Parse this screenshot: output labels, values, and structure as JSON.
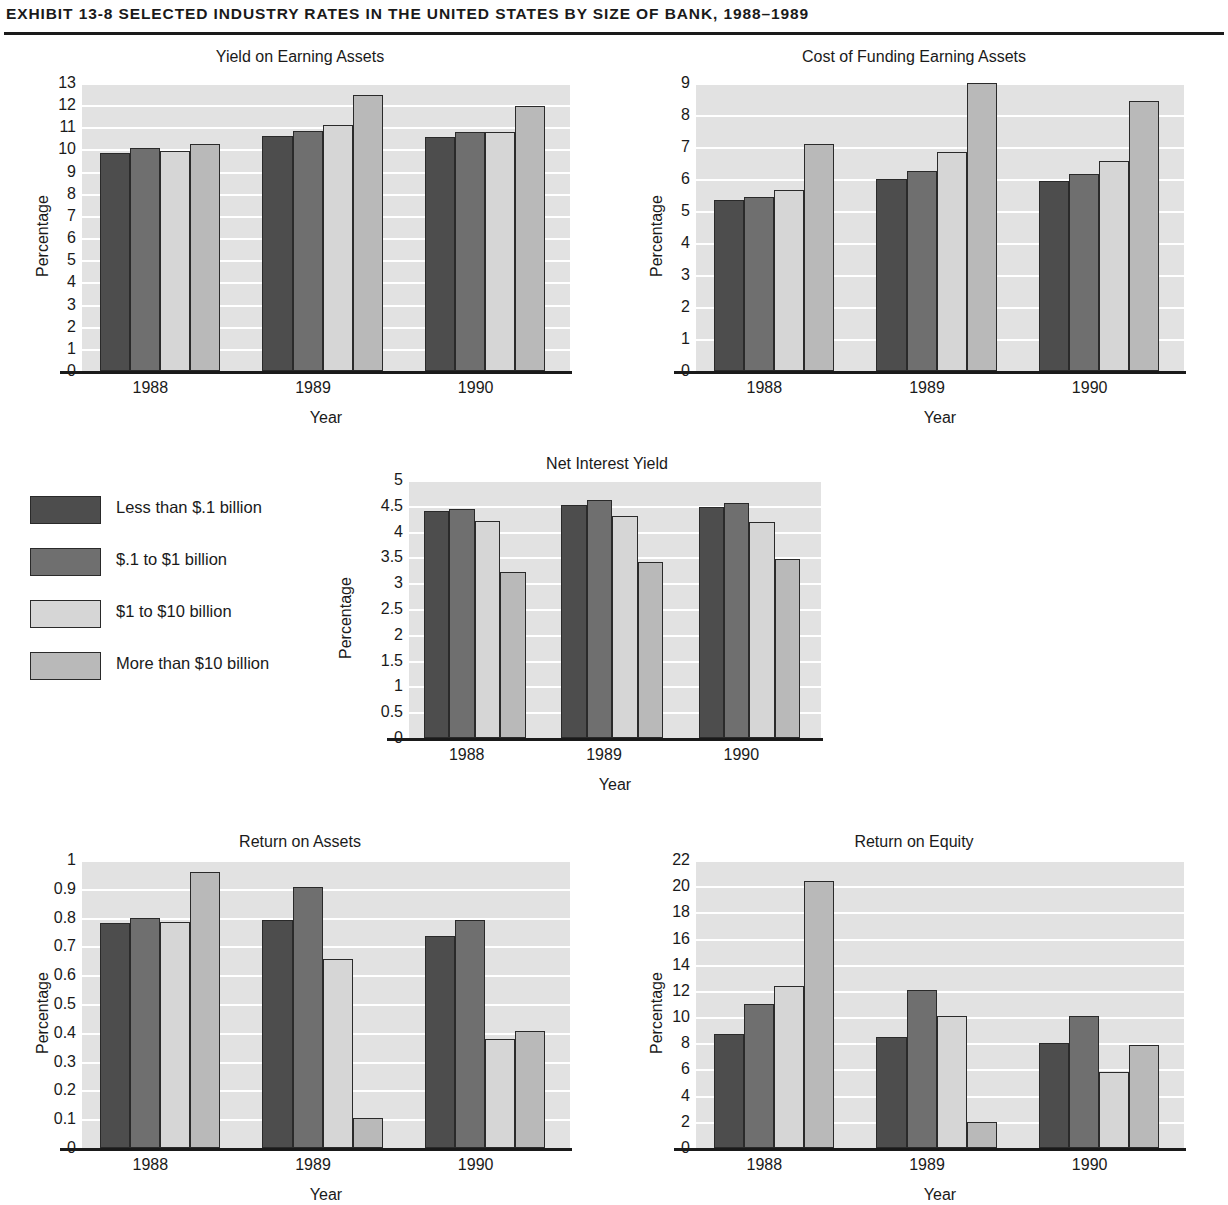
{
  "exhibit": {
    "title": "EXHIBIT 13-8   SELECTED INDUSTRY RATES IN THE UNITED STATES BY SIZE OF BANK, 1988–1989"
  },
  "legend": {
    "items": [
      {
        "label": "Less than $.1 billion",
        "color": "#4d4d4d"
      },
      {
        "label": "$.1 to $1 billion",
        "color": "#6f6f6f"
      },
      {
        "label": "$1 to $10 billion",
        "color": "#d6d6d6"
      },
      {
        "label": "More than $10 billion",
        "color": "#b9b9b9"
      }
    ]
  },
  "chart_data": [
    {
      "id": "yield-on-earning-assets",
      "type": "bar",
      "title": "Yield on Earning Assets",
      "xlabel": "Year",
      "ylabel": "Percentage",
      "categories": [
        "1988",
        "1989",
        "1990"
      ],
      "ylim": [
        0,
        13
      ],
      "yticks": [
        "0",
        "1",
        "2",
        "3",
        "4",
        "5",
        "6",
        "7",
        "8",
        "9",
        "10",
        "11",
        "12",
        "13"
      ],
      "grid": true,
      "legend_position": "external-left",
      "series": [
        {
          "name": "Less than $.1 billion",
          "values": [
            9.85,
            10.6,
            10.55
          ]
        },
        {
          "name": "$.1 to $1 billion",
          "values": [
            10.05,
            10.85,
            10.8
          ]
        },
        {
          "name": "$1 to $10 billion",
          "values": [
            9.95,
            11.1,
            10.8
          ]
        },
        {
          "name": "More than $10 billion",
          "values": [
            10.25,
            12.45,
            11.95
          ]
        }
      ]
    },
    {
      "id": "cost-of-funding-earning-assets",
      "type": "bar",
      "title": "Cost of Funding Earning Assets",
      "xlabel": "Year",
      "ylabel": "Percentage",
      "categories": [
        "1988",
        "1989",
        "1990"
      ],
      "ylim": [
        0,
        9
      ],
      "yticks": [
        "0",
        "1",
        "2",
        "3",
        "4",
        "5",
        "6",
        "7",
        "8",
        "9"
      ],
      "grid": true,
      "legend_position": "external-left",
      "series": [
        {
          "name": "Less than $.1 billion",
          "values": [
            5.35,
            6.0,
            5.95
          ]
        },
        {
          "name": "$.1 to $1 billion",
          "values": [
            5.45,
            6.25,
            6.15
          ]
        },
        {
          "name": "$1 to $10 billion",
          "values": [
            5.65,
            6.85,
            6.55
          ]
        },
        {
          "name": "More than $10 billion",
          "values": [
            7.1,
            9.0,
            8.45
          ]
        }
      ]
    },
    {
      "id": "net-interest-yield",
      "type": "bar",
      "title": "Net Interest Yield",
      "xlabel": "Year",
      "ylabel": "Percentage",
      "categories": [
        "1988",
        "1989",
        "1990"
      ],
      "ylim": [
        0,
        5
      ],
      "yticks": [
        "0",
        "0.5",
        "1",
        "1.5",
        "2",
        "2.5",
        "3",
        "3.5",
        "4",
        "4.5",
        "5"
      ],
      "grid": true,
      "legend_position": "external-left",
      "series": [
        {
          "name": "Less than $.1 billion",
          "values": [
            4.4,
            4.52,
            4.47
          ]
        },
        {
          "name": "$.1 to $1 billion",
          "values": [
            4.43,
            4.62,
            4.55
          ]
        },
        {
          "name": "$1 to $10 billion",
          "values": [
            4.2,
            4.3,
            4.18
          ]
        },
        {
          "name": "More than $10 billion",
          "values": [
            3.22,
            3.42,
            3.46
          ]
        }
      ]
    },
    {
      "id": "return-on-assets",
      "type": "bar",
      "title": "Return on Assets",
      "xlabel": "Year",
      "ylabel": "Percentage",
      "categories": [
        "1988",
        "1989",
        "1990"
      ],
      "ylim": [
        0,
        1
      ],
      "yticks": [
        "0",
        "0.1",
        "0.2",
        "0.3",
        "0.4",
        "0.5",
        "0.6",
        "0.7",
        "0.8",
        "0.9",
        "1"
      ],
      "grid": true,
      "legend_position": "external-left",
      "series": [
        {
          "name": "Less than $.1 billion",
          "values": [
            0.78,
            0.79,
            0.735
          ]
        },
        {
          "name": "$.1 to $1 billion",
          "values": [
            0.8,
            0.905,
            0.79
          ]
        },
        {
          "name": "$1 to $10 billion",
          "values": [
            0.785,
            0.655,
            0.378
          ]
        },
        {
          "name": "More than $10 billion",
          "values": [
            0.96,
            0.105,
            0.405
          ]
        }
      ]
    },
    {
      "id": "return-on-equity",
      "type": "bar",
      "title": "Return on Equity",
      "xlabel": "Year",
      "ylabel": "Percentage",
      "categories": [
        "1988",
        "1989",
        "1990"
      ],
      "ylim": [
        0,
        22
      ],
      "yticks": [
        "0",
        "2",
        "4",
        "6",
        "8",
        "10",
        "12",
        "14",
        "16",
        "18",
        "20",
        "22"
      ],
      "grid": true,
      "legend_position": "external-left",
      "series": [
        {
          "name": "Less than $.1 billion",
          "values": [
            8.7,
            8.5,
            8.0
          ]
        },
        {
          "name": "$.1 to $1 billion",
          "values": [
            11.0,
            12.1,
            10.1
          ]
        },
        {
          "name": "$1 to $10 billion",
          "values": [
            12.4,
            10.1,
            5.8
          ]
        },
        {
          "name": "More than $10 billion",
          "values": [
            20.4,
            1.95,
            7.85
          ]
        }
      ]
    }
  ],
  "layout": {
    "panels": [
      {
        "id": "yield-on-earning-assets",
        "left": 0,
        "top": 48,
        "width": 600,
        "plotLeft": 82,
        "plotTop": 35,
        "plotWidth": 488,
        "plotHeight": 288
      },
      {
        "id": "cost-of-funding-earning-assets",
        "left": 614,
        "top": 48,
        "width": 600,
        "plotLeft": 82,
        "plotTop": 35,
        "plotWidth": 488,
        "plotHeight": 288
      },
      {
        "id": "net-interest-yield",
        "left": 307,
        "top": 455,
        "width": 600,
        "plotLeft": 102,
        "plotTop": 25,
        "plotWidth": 412,
        "plotHeight": 258
      },
      {
        "id": "return-on-assets",
        "left": 0,
        "top": 833,
        "width": 600,
        "plotLeft": 82,
        "plotTop": 27,
        "plotWidth": 488,
        "plotHeight": 288
      },
      {
        "id": "return-on-equity",
        "left": 614,
        "top": 833,
        "width": 600,
        "plotLeft": 82,
        "plotTop": 27,
        "plotWidth": 488,
        "plotHeight": 288
      }
    ]
  }
}
